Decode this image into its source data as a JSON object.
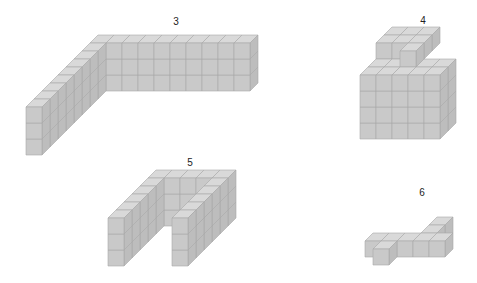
{
  "figure": {
    "background": "#ffffff",
    "cube_colors": {
      "front": "#c9c9c9",
      "top": "#d9d9d9",
      "side": "#bdbdbd",
      "edge": "#a8a8a8"
    },
    "cell_size": 16,
    "depth_offset": [
      8,
      -8
    ],
    "shapes": [
      {
        "id": "3",
        "label": "3",
        "label_pos": [
          176,
          21
        ],
        "description": "L-shaped wall: long back wall 9 cubes wide x 3 high, plus diagonal receding arm 8 cubes deep x 3 high",
        "origin": [
          26,
          155
        ],
        "cubes": "arm"
      },
      {
        "id": "4",
        "label": "4",
        "label_pos": [
          423,
          20
        ],
        "description": "Block 5 wide x 4 high x 3 deep with a rear raised L-section on top",
        "origin": [
          360,
          139
        ]
      },
      {
        "id": "5",
        "label": "5",
        "label_pos": [
          190,
          162
        ],
        "description": "U-shaped arch: two front pillars and a back wall, 3 cubes high",
        "origin": [
          108,
          266
        ]
      },
      {
        "id": "6",
        "label": "6",
        "label_pos": [
          422,
          192
        ],
        "description": "Cross shape: 5-cube bar with one cube arm forward and two cubes arm backward, 1 cube high",
        "origin": [
          357,
          265
        ]
      }
    ]
  }
}
